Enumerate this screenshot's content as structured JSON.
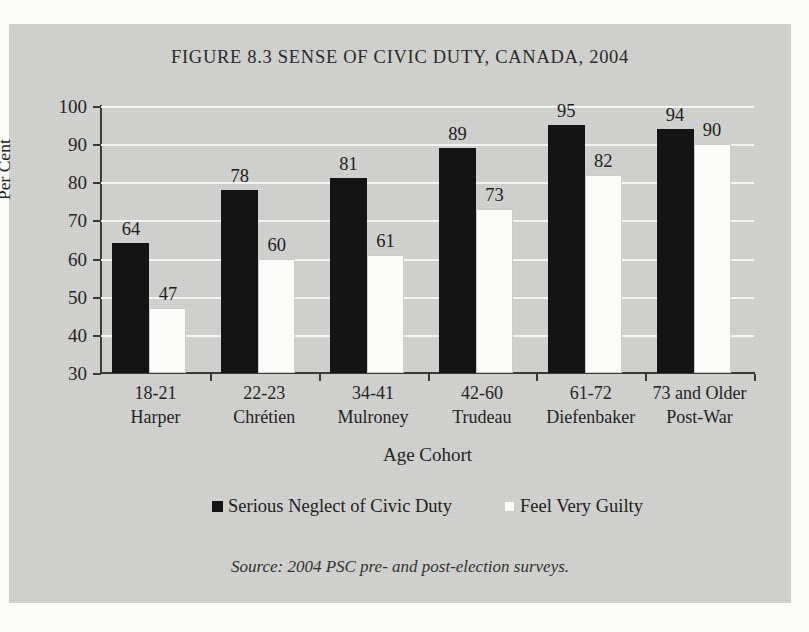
{
  "figure": {
    "title": "FIGURE 8.3 SENSE OF CIVIC DUTY, CANADA, 2004",
    "source_note": "Source: 2004 PSC pre- and post-election surveys.",
    "panel_color": "#d2d2d0",
    "page_color": "#fbfbfa"
  },
  "chart_data": {
    "type": "bar",
    "title": "FIGURE 8.3 SENSE OF CIVIC DUTY, CANADA, 2004",
    "xlabel": "Age Cohort",
    "ylabel": "Per Cent",
    "ylim": [
      30,
      100
    ],
    "ytick_step": 10,
    "yticks": [
      30,
      40,
      50,
      60,
      70,
      80,
      90,
      100
    ],
    "grid": true,
    "grid_axis": "y",
    "legend_position": "bottom",
    "categories": [
      "18-21",
      "22-23",
      "34-41",
      "42-60",
      "61-72",
      "73 and Older"
    ],
    "category_sublabels": [
      "Harper",
      "Chrétien",
      "Mulroney",
      "Trudeau",
      "Diefenbaker",
      "Post-War"
    ],
    "series": [
      {
        "name": "Serious Neglect of Civic Duty",
        "color": "#141414",
        "values": [
          64,
          78,
          81,
          89,
          95,
          94
        ]
      },
      {
        "name": "Feel Very Guilty",
        "color": "#fbfbf9",
        "values": [
          47,
          60,
          61,
          73,
          82,
          90
        ]
      }
    ]
  }
}
